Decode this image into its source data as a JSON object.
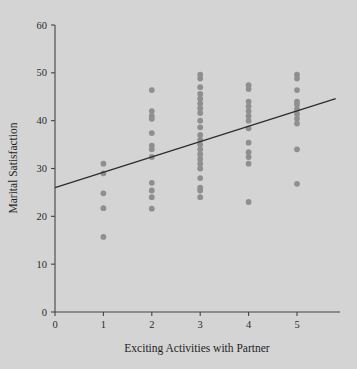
{
  "figure": {
    "background_color": "#d4d4d4",
    "point_color": "#8f8f8f",
    "line_color": "#2c2c2c",
    "axis_color": "#444444"
  },
  "axes": {
    "x_title": "Exciting Activities with Partner",
    "y_title": "Marital Satisfaction",
    "x_ticks": [
      "0",
      "1",
      "2",
      "3",
      "4",
      "5"
    ],
    "y_ticks": [
      "0",
      "10",
      "20",
      "30",
      "40",
      "50",
      "60"
    ]
  },
  "chart_data": {
    "type": "scatter",
    "title": "",
    "xlabel": "Exciting Activities with Partner",
    "ylabel": "Marital Satisfaction",
    "xlim": [
      0,
      5.8
    ],
    "ylim": [
      0,
      60
    ],
    "xticks": [
      0,
      1,
      2,
      3,
      4,
      5
    ],
    "yticks": [
      0,
      10,
      20,
      30,
      40,
      50,
      60
    ],
    "grid": false,
    "legend": false,
    "series": [
      {
        "name": "Observations",
        "marker": "circle",
        "color": "#8f8f8f",
        "x": [
          1,
          1,
          1,
          1,
          1,
          2,
          2,
          2,
          2,
          2,
          2,
          2,
          2,
          2,
          2,
          2,
          2,
          3,
          3,
          3,
          3,
          3,
          3,
          3,
          3,
          3,
          3,
          3,
          3,
          3,
          3,
          3,
          3,
          3,
          3,
          3,
          3,
          3,
          3,
          4,
          4,
          4,
          4,
          4,
          4,
          4,
          4,
          4,
          4,
          4,
          4,
          4,
          5,
          5,
          5,
          5,
          5,
          5,
          5,
          5,
          5,
          5,
          5
        ],
        "y": [
          31.0,
          29.0,
          24.8,
          21.7,
          15.7,
          46.4,
          42.0,
          41.0,
          40.4,
          37.4,
          34.8,
          34.0,
          32.4,
          27.0,
          25.4,
          24.0,
          21.6,
          49.6,
          48.8,
          47.0,
          45.6,
          44.6,
          43.6,
          42.6,
          41.6,
          40.0,
          38.6,
          37.0,
          36.0,
          35.0,
          34.0,
          33.0,
          32.0,
          31.0,
          30.0,
          28.0,
          26.0,
          25.4,
          24.0,
          47.4,
          46.6,
          44.0,
          43.0,
          42.0,
          41.0,
          40.0,
          38.4,
          35.4,
          33.4,
          32.4,
          31.0,
          23.0,
          49.6,
          48.8,
          46.4,
          44.0,
          43.4,
          42.4,
          41.4,
          40.4,
          39.4,
          34.0,
          26.8
        ]
      }
    ],
    "trendline": {
      "type": "linear",
      "label": "regression line",
      "intercept": 26.0,
      "slope": 3.2,
      "x_start": 0,
      "x_end": 5.8,
      "y_start": 26.0,
      "y_end": 44.6
    }
  }
}
